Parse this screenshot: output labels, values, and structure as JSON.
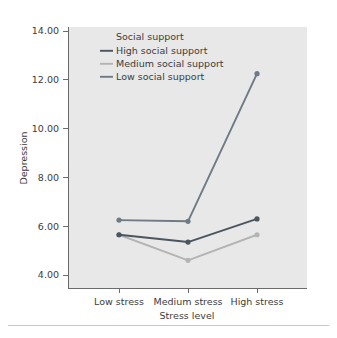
{
  "chart_data": {
    "type": "line",
    "title": "",
    "xlabel": "Stress level",
    "ylabel": "Depression",
    "categories": [
      "Low stress",
      "Medium stress",
      "High stress"
    ],
    "ylim": [
      4.0,
      14.0
    ],
    "y_ticks": [
      "4.00",
      "6.00",
      "8.00",
      "10.00",
      "12.00",
      "14.00"
    ],
    "y_tick_values": [
      4.0,
      6.0,
      8.0,
      10.0,
      12.0,
      14.0
    ],
    "grid": false,
    "legend_position": "inside-top-left",
    "legend_title": "Social support",
    "markers": true,
    "series": [
      {
        "name": "High social support",
        "values": [
          5.65,
          5.35,
          6.3
        ],
        "color": "#4a5560"
      },
      {
        "name": "Medium social support",
        "values": [
          5.65,
          4.6,
          5.65
        ],
        "color": "#b4b4b4"
      },
      {
        "name": "Low social support",
        "values": [
          6.25,
          6.2,
          12.25
        ],
        "color": "#6e7a86"
      }
    ]
  },
  "axes": {
    "y_title": "Depression",
    "x_title": "Stress level",
    "y_tick_labels": [
      "14.00",
      "12.00",
      "10.00",
      "8.00",
      "6.00",
      "4.00"
    ],
    "x_tick_labels": [
      "Low stress",
      "Medium stress",
      "High stress"
    ]
  },
  "legend": {
    "title": "Social support",
    "items": [
      {
        "label": "High social support",
        "color": "#4a5560"
      },
      {
        "label": "Medium social support",
        "color": "#b4b4b4"
      },
      {
        "label": "Low social support",
        "color": "#6e7a86"
      }
    ]
  },
  "colors": {
    "panel_background": "#e8e8e8",
    "page_background": "#ffffff",
    "axis": "#6b6b6b",
    "text": "#3c3c3c",
    "separator": "#c8c8c8"
  }
}
